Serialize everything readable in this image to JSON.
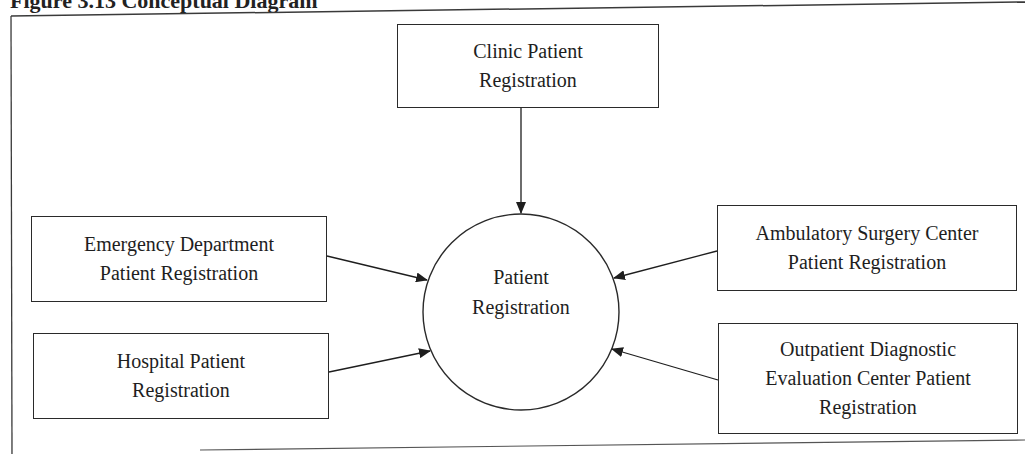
{
  "figure": {
    "title_fragment": "Figure 3.13  Conceptual Diagram"
  },
  "diagram": {
    "center": {
      "shape": "circle",
      "label": "Patient Registration",
      "lines": [
        "Patient",
        "Registration"
      ]
    },
    "nodes": [
      {
        "id": "clinic",
        "shape": "rectangle",
        "position": "top",
        "label": "Clinic Patient Registration",
        "lines": [
          "Clinic Patient",
          "Registration"
        ]
      },
      {
        "id": "emergency",
        "shape": "rectangle",
        "position": "left-upper",
        "label": "Emergency Department Patient Registration",
        "lines": [
          "Emergency Department",
          "Patient Registration"
        ]
      },
      {
        "id": "hospital",
        "shape": "rectangle",
        "position": "left-lower",
        "label": "Hospital Patient Registration",
        "lines": [
          "Hospital Patient",
          "Registration"
        ]
      },
      {
        "id": "ambulatory",
        "shape": "rectangle",
        "position": "right-upper",
        "label": "Ambulatory Surgery Center Patient Registration",
        "lines": [
          "Ambulatory Surgery Center",
          "Patient Registration"
        ]
      },
      {
        "id": "outpatient",
        "shape": "rectangle",
        "position": "right-lower",
        "label": "Outpatient Diagnostic Evaluation Center Patient Registration",
        "lines": [
          "Outpatient Diagnostic",
          "Evaluation Center Patient",
          "Registration"
        ]
      }
    ],
    "edges": [
      {
        "from": "clinic",
        "to": "center",
        "arrow": "end"
      },
      {
        "from": "emergency",
        "to": "center",
        "arrow": "end"
      },
      {
        "from": "hospital",
        "to": "center",
        "arrow": "end"
      },
      {
        "from": "ambulatory",
        "to": "center",
        "arrow": "end"
      },
      {
        "from": "outpatient",
        "to": "center",
        "arrow": "end"
      }
    ],
    "colors": {
      "stroke": "#2a2a2a",
      "text": "#1e1e1e",
      "background": "#ffffff"
    }
  }
}
